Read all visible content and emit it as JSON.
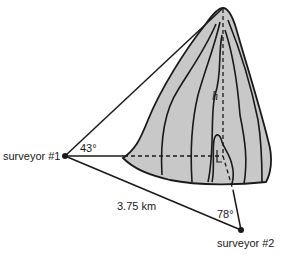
{
  "diagram": {
    "labels": {
      "surveyor1": "surveyor #1",
      "surveyor2": "surveyor #2",
      "angle1": "43°",
      "angle2": "78°",
      "distance": "3.75 km",
      "height": "h"
    },
    "colors": {
      "mountain_fill": "#c8c8c8",
      "line": "#1a1a1a",
      "background": "#ffffff"
    }
  }
}
